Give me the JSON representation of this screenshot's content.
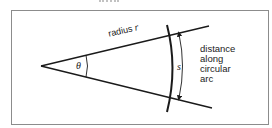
{
  "diagram": {
    "labels": {
      "radius_text": "radius",
      "radius_var": "r",
      "angle_var": "θ",
      "arc_var": "s",
      "arc_description": [
        "distance",
        "along",
        "circular",
        "arc"
      ]
    },
    "geometry": {
      "apex": [
        41,
        66
      ],
      "upper_ray_end": [
        209,
        26
      ],
      "lower_ray_end": [
        212,
        108
      ],
      "arc_top": [
        168,
        26
      ],
      "arc_bottom": [
        169,
        111
      ],
      "arc_bulge_x": 175,
      "arrow_top": [
        180,
        33
      ],
      "arrow_bottom": [
        181,
        98
      ],
      "theta_arc_x": 87
    },
    "colors": {
      "stroke": "#1a1a1a",
      "frame": "#8c8c8c",
      "text": "#222222"
    }
  }
}
